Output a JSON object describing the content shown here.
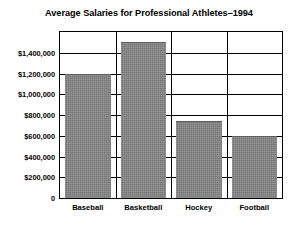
{
  "chart_data": {
    "type": "bar",
    "title": "Average Salaries for Professional Athletes–1994",
    "xlabel": "",
    "ylabel": "",
    "categories": [
      "Baseball",
      "Basketball",
      "Hockey",
      "Football"
    ],
    "values": [
      1200000,
      1500000,
      740000,
      600000
    ],
    "ylim": [
      0,
      1600000
    ],
    "ytick_values": [
      0,
      200000,
      400000,
      600000,
      800000,
      1000000,
      1200000,
      1400000
    ],
    "ytick_labels": [
      "0",
      "$200,000",
      "$400,000",
      "$600,000",
      "$800,000",
      "$1,000,000",
      "$1,200,000",
      "$1,400,000"
    ],
    "grid": true,
    "legend": null,
    "bar_color": "#808080",
    "axis_color": "#000000",
    "background_color": "#ffffff"
  }
}
